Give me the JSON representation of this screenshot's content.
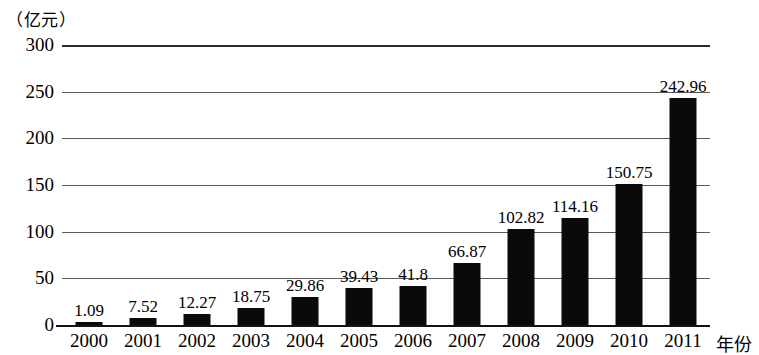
{
  "chart_data": {
    "type": "bar",
    "title": "",
    "subtitle": "",
    "xlabel": "年份",
    "ylabel": "（亿元）",
    "unit_caption": "（亿元）",
    "categories": [
      "2000",
      "2001",
      "2002",
      "2003",
      "2004",
      "2005",
      "2006",
      "2007",
      "2008",
      "2009",
      "2010",
      "2011"
    ],
    "values": [
      1.09,
      7.52,
      12.27,
      18.75,
      29.86,
      39.43,
      41.8,
      66.87,
      102.82,
      114.16,
      150.75,
      242.96
    ],
    "value_labels": [
      "1.09",
      "7.52",
      "12.27",
      "18.75",
      "29.86",
      "39.43",
      "41.8",
      "66.87",
      "102.82",
      "114.16",
      "150.75",
      "242.96"
    ],
    "ylim": [
      0,
      300
    ],
    "yticks": [
      0,
      50,
      100,
      150,
      200,
      250,
      300
    ],
    "ytick_labels": [
      "0",
      "50",
      "100",
      "150",
      "200",
      "250",
      "300"
    ],
    "grid": true,
    "grid_axis": "y",
    "legend": false,
    "legend_position": "none",
    "bar_color": "#0a0a0a",
    "grid_color": "#5a5a5a",
    "axis_color": "#141414",
    "background_color": "#ffffff"
  }
}
